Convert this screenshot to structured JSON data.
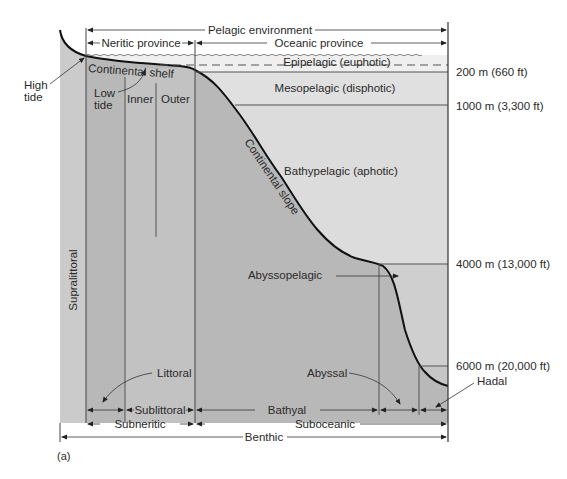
{
  "title": "Pelagic environment",
  "provinces": {
    "neritic": "Neritic province",
    "oceanic": "Oceanic province"
  },
  "pelagic_zones": [
    {
      "label": "Epipelagic (euphotic)",
      "depth": "200 m (660 ft)"
    },
    {
      "label": "Mesopelagic (disphotic)",
      "depth": "1000 m (3,300 ft)"
    },
    {
      "label": "Bathypelagic (aphotic)",
      "depth": "4000 m (13,000 ft)"
    },
    {
      "label": "Abyssopelagic",
      "depth": "6000 m (20,000 ft)"
    }
  ],
  "shore_labels": {
    "high_tide": [
      "High",
      "tide"
    ],
    "low_tide": [
      "Low",
      "tide"
    ],
    "continental_shelf": "Continental shelf",
    "continental_slope": "Continental slope",
    "inner": "Inner",
    "outer": "Outer",
    "supralittoral": "Supralittoral"
  },
  "benthic_zones": {
    "littoral": "Littoral",
    "sublittoral": "Sublittoral",
    "bathyal": "Bathyal",
    "abyssal": "Abyssal",
    "hadal": "Hadal",
    "subneritic": "Subneritic",
    "suboceanic": "Suboceanic",
    "benthic": "Benthic"
  },
  "panel_label": "(a)",
  "colors": {
    "surface_water": "#ececec",
    "mesopelagic": "#dedede",
    "deep_water": "#d2d2d2",
    "seafloor": "#b5b5b5",
    "supralittoral": "#c8c8c8",
    "line": "#222222"
  }
}
